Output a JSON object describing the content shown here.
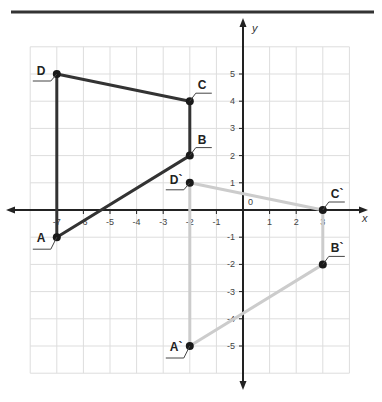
{
  "header_rule": true,
  "axes": {
    "x_label": "x",
    "y_label": "y",
    "origin_label": "0",
    "x_range": [
      -8,
      4
    ],
    "y_range": [
      -6,
      6
    ],
    "x_ticks": [
      {
        "v": -7,
        "label": "-7"
      },
      {
        "v": -6,
        "label": "-6"
      },
      {
        "v": -5,
        "label": "-5"
      },
      {
        "v": -4,
        "label": "-4"
      },
      {
        "v": -3,
        "label": "-3"
      },
      {
        "v": -2,
        "label": "-2"
      },
      {
        "v": -1,
        "label": "-1"
      },
      {
        "v": 1,
        "label": "1"
      },
      {
        "v": 2,
        "label": "2"
      },
      {
        "v": 3,
        "label": "3"
      }
    ],
    "y_ticks": [
      {
        "v": 5,
        "label": "5"
      },
      {
        "v": 4,
        "label": "4"
      },
      {
        "v": 3,
        "label": "3"
      },
      {
        "v": 2,
        "label": "2"
      },
      {
        "v": 1,
        "label": "1"
      },
      {
        "v": -1,
        "label": "-1"
      },
      {
        "v": -2,
        "label": "-2"
      },
      {
        "v": -3,
        "label": "-3"
      },
      {
        "v": -4,
        "label": "-4"
      },
      {
        "v": -5,
        "label": "-5"
      }
    ]
  },
  "shapes": [
    {
      "name": "original",
      "stroke": "#333333",
      "points": [
        {
          "label": "A",
          "x": -7,
          "y": -1,
          "label_side": "left-below"
        },
        {
          "label": "B",
          "x": -2,
          "y": 2,
          "label_side": "right-above"
        },
        {
          "label": "C",
          "x": -2,
          "y": 4,
          "label_side": "right-above"
        },
        {
          "label": "D",
          "x": -7,
          "y": 5,
          "label_side": "left-above"
        }
      ]
    },
    {
      "name": "image",
      "stroke": "#cccccc",
      "points": [
        {
          "label": "A`",
          "x": -2,
          "y": -5,
          "label_side": "left-below"
        },
        {
          "label": "B`",
          "x": 3,
          "y": -2,
          "label_side": "right-above"
        },
        {
          "label": "C`",
          "x": 3,
          "y": 0,
          "label_side": "right-above"
        },
        {
          "label": "D`",
          "x": -2,
          "y": 1,
          "label_side": "left-above"
        }
      ]
    }
  ],
  "colors": {
    "grid": "#dddddd",
    "axis": "#222222",
    "point": "#1a1a1a",
    "rule": "#333333"
  }
}
